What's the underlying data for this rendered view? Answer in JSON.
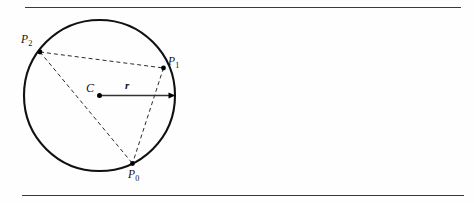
{
  "figure": {
    "rules": {
      "top_rule": "horizontal-rule",
      "bottom_rule": "horizontal-rule"
    },
    "labels": {
      "center": "C",
      "radius": "r",
      "point0_base": "P",
      "point0_sub": "0",
      "point1_base": "P",
      "point1_sub": "1",
      "point2_base": "P",
      "point2_sub": "2"
    },
    "colors": {
      "circle_stroke": "#111111",
      "dashed_stroke": "#2b2b2b",
      "radius_stroke": "#333333",
      "rule_stroke": "#3a3a3a",
      "dot_fill": "#000000",
      "background": "#fefefe"
    },
    "geometry": {
      "center": {
        "x": 99.5,
        "y": 95.5
      },
      "radius": 75.5,
      "radius_arrow_tip": {
        "x": 175.5,
        "y": 95.5
      },
      "points": [
        {
          "name": "P0",
          "x": 132.5,
          "y": 163.5
        },
        {
          "name": "P1",
          "x": 163.5,
          "y": 68.0
        },
        {
          "name": "P2",
          "x": 40.0,
          "y": 52.0
        }
      ],
      "chords": [
        {
          "from": "P2",
          "to": "P1"
        },
        {
          "from": "P2",
          "to": "P0"
        },
        {
          "from": "P1",
          "to": "P0"
        }
      ],
      "top_rule": {
        "x1": 25,
        "y1": 7.5,
        "x2": 461,
        "y2": 7.5
      },
      "bottom_rule": {
        "x1": 22,
        "y1": 195.5,
        "x2": 464,
        "y2": 195.5
      }
    }
  }
}
